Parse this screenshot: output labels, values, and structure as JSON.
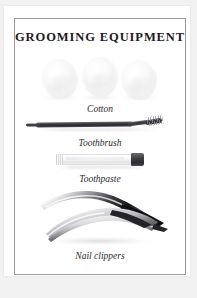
{
  "plate": {
    "title": "GROOMING EQUIPMENT",
    "background_color": "#f2f2f2",
    "paper_color": "#ffffff",
    "border_color": "#9a9a9a",
    "title_color": "#1b1b22"
  },
  "specimens": [
    {
      "id": "cotton",
      "caption": "Cotton",
      "icon": "cotton-balls-icon",
      "count": 3,
      "color": "#f7f7f7"
    },
    {
      "id": "toothbrush",
      "caption": "Toothbrush",
      "icon": "toothbrush-icon",
      "color": "#33333a"
    },
    {
      "id": "toothpaste",
      "caption": "Toothpaste",
      "icon": "toothpaste-tube-icon",
      "body_color": "#f2f2f3",
      "cap_color": "#3f3f46"
    },
    {
      "id": "nail-clippers",
      "caption": "Nail clippers",
      "icon": "nail-clippers-icon",
      "color": "#1a1a1a"
    }
  ]
}
